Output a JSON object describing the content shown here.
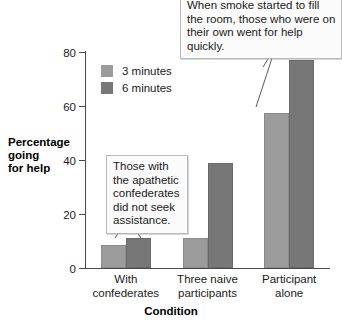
{
  "chart_data": {
    "type": "bar",
    "title": "",
    "xlabel": "Condition",
    "ylabel": "Percentage going for help",
    "ylabel_lines": [
      "Percentage",
      "going",
      "for help"
    ],
    "categories": [
      "With confederates",
      "Three naive participants",
      "Participant alone"
    ],
    "category_lines": [
      [
        "With",
        "confederates"
      ],
      [
        "Three naive",
        "participants"
      ],
      [
        "Participant",
        "alone"
      ]
    ],
    "series": [
      {
        "name": "3 minutes",
        "values": [
          8.5,
          11,
          57.5
        ],
        "color": "#9b9b9b"
      },
      {
        "name": "6 minutes",
        "values": [
          11,
          39,
          77
        ],
        "color": "#777777"
      }
    ],
    "ylim": [
      0,
      80
    ],
    "yticks": [
      0,
      20,
      40,
      60,
      80
    ],
    "ytick_labels": [
      "0",
      "20",
      "40",
      "60",
      "80"
    ],
    "grid": false,
    "legend_position": "upper-left-inside"
  },
  "legend": {
    "items": [
      {
        "label": "3 minutes",
        "color": "#9b9b9b"
      },
      {
        "label": "6 minutes",
        "color": "#777777"
      }
    ]
  },
  "annotations": [
    {
      "id": "callout-top",
      "text": "When smoke started to fill the room, those who were on their own went for help quickly."
    },
    {
      "id": "callout-inner",
      "text": "Those with the apathetic confederates did not seek assistance."
    }
  ],
  "axes": {
    "x_title": "Condition",
    "y_title_line1": "Percentage",
    "y_title_line2": "going",
    "y_title_line3": "for help"
  },
  "colors": {
    "series_light": "#9b9b9b",
    "series_dark": "#777777",
    "axis": "#4a4a4a",
    "callout_border": "#b9b9b9",
    "callout_bg": "#fbfbfb",
    "background": "#ffffff"
  }
}
